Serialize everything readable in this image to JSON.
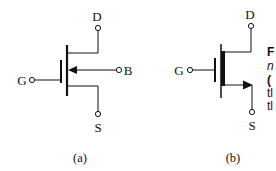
{
  "figure": {
    "panels": [
      {
        "id": "a",
        "caption": "(a)",
        "description": "n-channel enhancement MOSFET symbol with separate body (B) terminal; arrow points inward on body lead",
        "terminals": {
          "drain": "D",
          "gate": "G",
          "source": "S",
          "body": "B"
        }
      },
      {
        "id": "b",
        "caption": "(b)",
        "description": "simplified MOSFET symbol with arrow on source lead pointing outward; body connected to source",
        "terminals": {
          "drain": "D",
          "gate": "G",
          "source": "S"
        }
      }
    ],
    "side_caption_fragments": [
      "F",
      "n",
      "(",
      "tl",
      "tl"
    ],
    "colors": {
      "ink": "#111111",
      "background": "#ffffff"
    }
  }
}
